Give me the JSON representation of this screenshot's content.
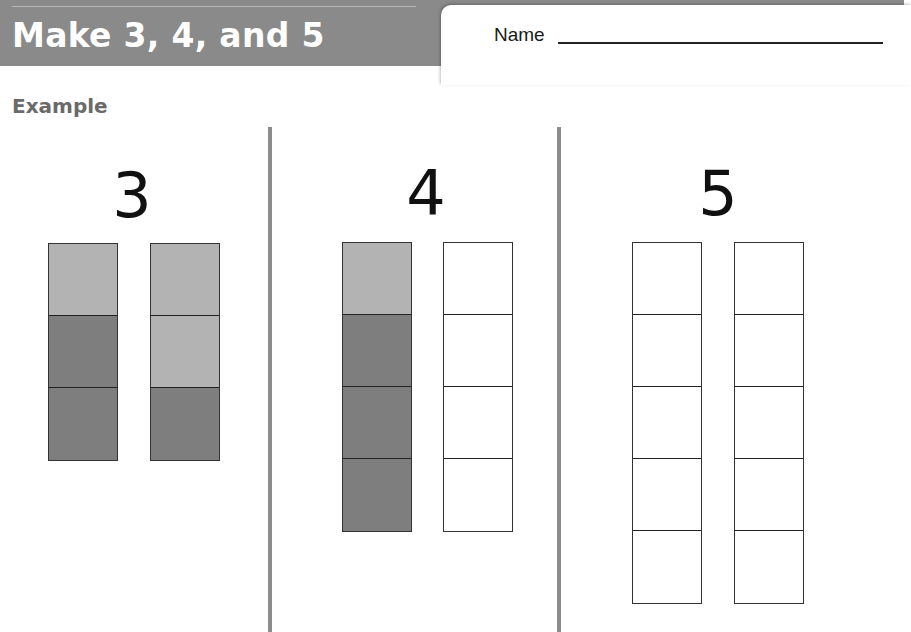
{
  "header": {
    "lesson_label": "Lesson 5",
    "title": "Make 3, 4, and 5",
    "band_color": "#8a8a8a",
    "title_color": "#ffffff"
  },
  "name_field": {
    "label": "Name",
    "value": ""
  },
  "example_label": "Example",
  "colors": {
    "light_cube": "#b3b3b3",
    "dark_cube": "#7e7e7e",
    "empty_cube": "#ffffff",
    "divider": "#8c8c8c"
  },
  "sections": [
    {
      "number": "3",
      "towers": [
        {
          "cubes": [
            "light",
            "dark",
            "dark"
          ]
        },
        {
          "cubes": [
            "light",
            "light",
            "dark"
          ]
        }
      ]
    },
    {
      "number": "4",
      "towers": [
        {
          "cubes": [
            "light",
            "dark",
            "dark",
            "dark"
          ]
        },
        {
          "cubes": [
            "empty",
            "empty",
            "empty",
            "empty"
          ]
        }
      ]
    },
    {
      "number": "5",
      "towers": [
        {
          "cubes": [
            "empty",
            "empty",
            "empty",
            "empty",
            "empty"
          ]
        },
        {
          "cubes": [
            "empty",
            "empty",
            "empty",
            "empty",
            "empty"
          ]
        }
      ]
    }
  ]
}
